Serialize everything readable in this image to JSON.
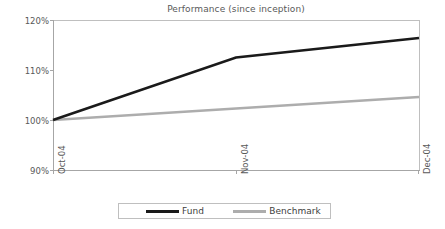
{
  "chart_data": {
    "type": "line",
    "title": "Performance (since inception)",
    "xlabel": "",
    "ylabel": "",
    "categories": [
      "Oct-04",
      "Nov-04",
      "Dec-04"
    ],
    "ylim": [
      90,
      120
    ],
    "yticks": [
      "90%",
      "100%",
      "110%",
      "120%"
    ],
    "ytick_values": [
      90,
      100,
      110,
      120
    ],
    "grid": false,
    "legend_position": "bottom",
    "series": [
      {
        "name": "Fund",
        "color": "#1a1a1a",
        "values": [
          100.0,
          112.5,
          116.4
        ]
      },
      {
        "name": "Benchmark",
        "color": "#adadad",
        "values": [
          100.0,
          102.3,
          104.6
        ]
      }
    ]
  },
  "legend": {
    "entries": [
      {
        "label": "Fund"
      },
      {
        "label": "Benchmark"
      }
    ]
  }
}
